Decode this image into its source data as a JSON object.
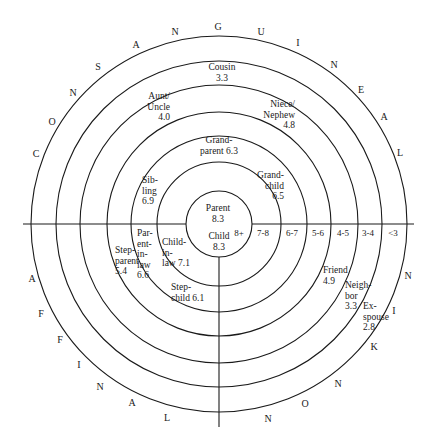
{
  "diagram": {
    "title": "",
    "center": {
      "x": 219,
      "y": 224
    },
    "rings": [
      33,
      62,
      88,
      112,
      139,
      163,
      188
    ],
    "colors": {
      "line": "#1a1a1a",
      "background": "#ffffff",
      "text": "#1a1a1a"
    },
    "outer_labels": {
      "consanguine": {
        "word": "CONSANGUINE",
        "letters": [
          {
            "ch": "C",
            "x": 36,
            "y": 157
          },
          {
            "ch": "O",
            "x": 52,
            "y": 125
          },
          {
            "ch": "N",
            "x": 73,
            "y": 96
          },
          {
            "ch": "S",
            "x": 98,
            "y": 70
          },
          {
            "ch": "A",
            "x": 136,
            "y": 48
          },
          {
            "ch": "N",
            "x": 175,
            "y": 35
          },
          {
            "ch": "G",
            "x": 218,
            "y": 30
          },
          {
            "ch": "U",
            "x": 261,
            "y": 35
          },
          {
            "ch": "I",
            "x": 298,
            "y": 46
          },
          {
            "ch": "N",
            "x": 334,
            "y": 68
          },
          {
            "ch": "E",
            "x": 361,
            "y": 93
          },
          {
            "ch": "A",
            "x": 384,
            "y": 120
          },
          {
            "ch": "L",
            "x": 400,
            "y": 156
          }
        ]
      },
      "affinal": {
        "word": "AFFINAL",
        "letters": [
          {
            "ch": "A",
            "x": 32,
            "y": 282
          },
          {
            "ch": "F",
            "x": 41,
            "y": 317
          },
          {
            "ch": "F",
            "x": 60,
            "y": 343
          },
          {
            "ch": "I",
            "x": 79,
            "y": 368
          },
          {
            "ch": "N",
            "x": 100,
            "y": 390
          },
          {
            "ch": "A",
            "x": 132,
            "y": 406
          },
          {
            "ch": "L",
            "x": 167,
            "y": 421
          }
        ]
      },
      "nonkin": {
        "word": "NONKIN",
        "letters": [
          {
            "ch": "N",
            "x": 408,
            "y": 279
          },
          {
            "ch": "I",
            "x": 394,
            "y": 314
          },
          {
            "ch": "K",
            "x": 374,
            "y": 350
          },
          {
            "ch": "N",
            "x": 338,
            "y": 387
          },
          {
            "ch": "O",
            "x": 305,
            "y": 407
          },
          {
            "ch": "N",
            "x": 268,
            "y": 422
          }
        ]
      }
    },
    "score_bands": [
      {
        "label": "8+",
        "x": 239,
        "y": 236
      },
      {
        "label": "7-8",
        "x": 263,
        "y": 236
      },
      {
        "label": "6-7",
        "x": 292,
        "y": 236
      },
      {
        "label": "5-6",
        "x": 318,
        "y": 236
      },
      {
        "label": "4-5",
        "x": 343,
        "y": 236
      },
      {
        "label": "3-4",
        "x": 368,
        "y": 236
      },
      {
        "label": "<3",
        "x": 393,
        "y": 236
      }
    ],
    "relations": [
      {
        "name": "Parent",
        "score": "8.3",
        "lines": [
          "Parent",
          "8.3"
        ],
        "x": 218,
        "y": 211,
        "anchor": "middle"
      },
      {
        "name": "Child",
        "score": "8.3",
        "lines": [
          "Child",
          "8.3"
        ],
        "x": 219,
        "y": 239,
        "anchor": "middle"
      },
      {
        "name": "Grandparent",
        "score": "6.3",
        "lines": [
          "Grand-",
          "parent  6.3"
        ],
        "x": 219,
        "y": 143,
        "anchor": "middle"
      },
      {
        "name": "Grandchild",
        "score": "6.5",
        "lines": [
          "Grand-",
          "child",
          "6.5"
        ],
        "x": 284,
        "y": 178,
        "anchor": "end"
      },
      {
        "name": "Sibling",
        "score": "6.9",
        "lines": [
          "Sib-",
          "ling",
          "6.9"
        ],
        "x": 142,
        "y": 183,
        "anchor": "start"
      },
      {
        "name": "Aunt/Uncle",
        "score": "4.0",
        "lines": [
          "Aunt/",
          "Uncle",
          "4.0"
        ],
        "x": 170,
        "y": 99,
        "anchor": "end"
      },
      {
        "name": "Niece/Nephew",
        "score": "4.8",
        "lines": [
          "Niece/",
          "Nephew",
          "4.8"
        ],
        "x": 295,
        "y": 107,
        "anchor": "end"
      },
      {
        "name": "Cousin",
        "score": "3.3",
        "lines": [
          "Cousin",
          "3.3"
        ],
        "x": 222,
        "y": 70,
        "anchor": "middle"
      },
      {
        "name": "Child-in-law",
        "score": "7.1",
        "lines": [
          "Child-",
          "in-",
          "law 7.1"
        ],
        "x": 162,
        "y": 245,
        "anchor": "start"
      },
      {
        "name": "Parent-in-law",
        "score": "6.6",
        "lines": [
          "Par-",
          "ent-",
          "in-",
          "law",
          "6.6"
        ],
        "x": 137,
        "y": 236,
        "anchor": "start"
      },
      {
        "name": "Stepparent",
        "score": "5.4",
        "lines": [
          "Step-",
          "parent",
          "5.4"
        ],
        "x": 115,
        "y": 253,
        "anchor": "start"
      },
      {
        "name": "Stepchild",
        "score": "6.1",
        "lines": [
          "Step-",
          "child  6.1"
        ],
        "x": 171,
        "y": 290,
        "anchor": "start"
      },
      {
        "name": "Friend",
        "score": "4.9",
        "lines": [
          "Friend",
          "4.9"
        ],
        "x": 323,
        "y": 273,
        "anchor": "start"
      },
      {
        "name": "Neighbor",
        "score": "3.3",
        "lines": [
          "Neigh-",
          "bor",
          "3.3"
        ],
        "x": 345,
        "y": 288,
        "anchor": "start"
      },
      {
        "name": "Ex-spouse",
        "score": "2.8",
        "lines": [
          "Ex-",
          "spouse",
          "2.8"
        ],
        "x": 363,
        "y": 309,
        "anchor": "start"
      }
    ]
  }
}
